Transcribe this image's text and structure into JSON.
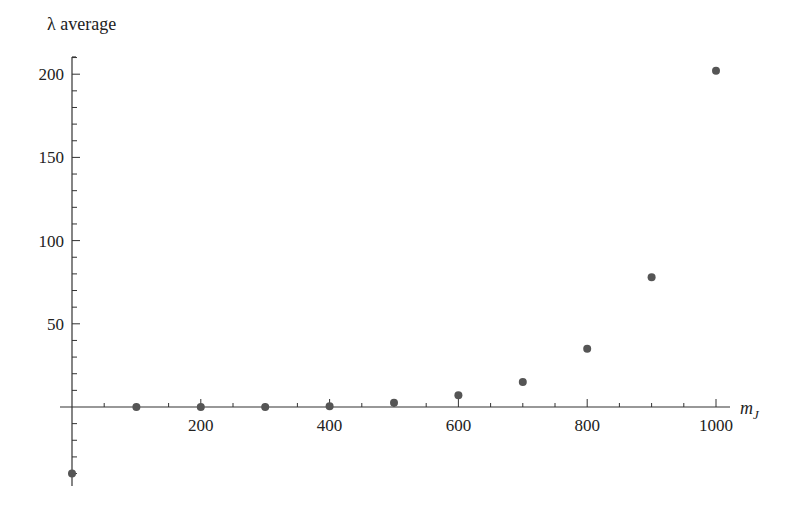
{
  "chart_data": {
    "type": "scatter",
    "title": "",
    "xlabel": "m_J",
    "ylabel": "λ average",
    "xlim": [
      0,
      1000
    ],
    "ylim": [
      -45,
      210
    ],
    "grid": false,
    "legend": null,
    "x_ticks": [
      200,
      400,
      600,
      800,
      1000
    ],
    "x_minor_step": 50,
    "y_ticks": [
      50,
      100,
      150,
      200
    ],
    "y_minor_step": 10,
    "marker_color": "#555555",
    "axis_color": "#333333",
    "series": [
      {
        "name": "λ average",
        "x": [
          0,
          100,
          200,
          300,
          400,
          500,
          600,
          700,
          800,
          900,
          1000
        ],
        "y": [
          -40,
          0,
          0,
          0,
          0.5,
          2.5,
          7,
          15,
          35,
          78,
          202
        ]
      }
    ]
  },
  "labels": {
    "y_title": "λ average",
    "x_title_main": "m",
    "x_title_sub": "J"
  }
}
